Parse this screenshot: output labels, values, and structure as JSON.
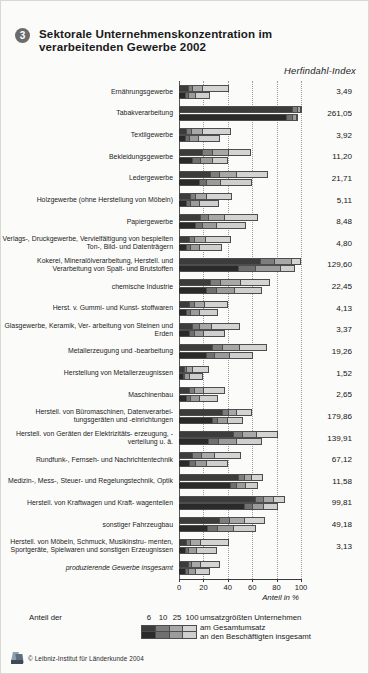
{
  "header": {
    "number": "3",
    "title": "Sektorale Unternehmenskonzentration im verarbeitenden Gewerbe 2002",
    "value_column_title": "Herfindahl-Index"
  },
  "footer": {
    "credit": "© Leibniz-Institut für Länderkunde 2004",
    "logo_name": "leibniz-institut-logo"
  },
  "legend": {
    "prefix": "Anteil der",
    "classes": [
      "6",
      "10",
      "25",
      "100"
    ],
    "suffix": "umsatzgrößten Unternehmen",
    "row1": "am Gesamtumsatz",
    "row2": "an den Beschäftigten insgesamt",
    "colors_row1": [
      "#3c3c3c",
      "#7d7d7d",
      "#a8a8a8",
      "#d4d4d4"
    ],
    "colors_row2": [
      "#2a2a2a",
      "#6f6f6f",
      "#9b9b9b",
      "#cfcfcf"
    ]
  },
  "chart_data": {
    "type": "bar",
    "orientation": "horizontal",
    "stacked": true,
    "grouped_pairs": true,
    "title": "Sektorale Unternehmenskonzentration im verarbeitenden Gewerbe 2002",
    "xlabel": "Anteil in %",
    "ylabel": "",
    "xlim": [
      0,
      100
    ],
    "xticks": [
      0,
      20,
      40,
      60,
      80,
      100
    ],
    "xtick_labels": [
      "0",
      "20",
      "40",
      "60",
      "80",
      "100"
    ],
    "grid": "vertical dotted at 20,40,60,80,100",
    "legend_position": "bottom",
    "value_axis_label": "Herfindahl-Index",
    "series": [
      {
        "name": "Anteil der 6 umsatzgrößten Unternehmen",
        "color": "#3c3c3c"
      },
      {
        "name": "Anteil der 10 umsatzgrößten Unternehmen",
        "color": "#7d7d7d"
      },
      {
        "name": "Anteil der 25 umsatzgrößten Unternehmen",
        "color": "#a8a8a8"
      },
      {
        "name": "Anteil der 100 umsatzgrößten Unternehmen",
        "color": "#d4d4d4"
      }
    ],
    "subseries": [
      {
        "name": "am Gesamtumsatz",
        "row": 1
      },
      {
        "name": "an den Beschäftigten insgesamt",
        "row": 2
      }
    ],
    "categories": [
      {
        "label": "Ernährungsgewerbe",
        "italic": false,
        "herfindahl": "3,49",
        "umsatz": [
          7.5,
          3.5,
          7.5,
          21.5
        ],
        "beschaeftigte": [
          5.0,
          2.5,
          6.0,
          11.0
        ]
      },
      {
        "label": "Tabakverarbeitung",
        "italic": false,
        "herfindahl": "261,05",
        "umsatz": [
          93.0,
          4.0,
          2.0,
          1.0
        ],
        "beschaeftigte": [
          88.0,
          4.5,
          3.0,
          1.5
        ]
      },
      {
        "label": "Textilgewerbe",
        "italic": false,
        "herfindahl": "3,92",
        "umsatz": [
          6.0,
          4.0,
          9.0,
          23.0
        ],
        "beschaeftigte": [
          5.0,
          3.0,
          7.5,
          17.0
        ]
      },
      {
        "label": "Bekleidungsgewerbe",
        "italic": false,
        "herfindahl": "11,20",
        "umsatz": [
          19.0,
          8.0,
          13.0,
          18.0
        ],
        "beschaeftigte": [
          11.0,
          6.0,
          10.0,
          12.5
        ]
      },
      {
        "label": "Ledergewerbe",
        "italic": false,
        "herfindahl": "21,71",
        "umsatz": [
          25.0,
          8.0,
          14.0,
          25.0
        ],
        "beschaeftigte": [
          16.0,
          6.0,
          12.0,
          25.0
        ]
      },
      {
        "label": "Holzgewerbe (ohne Herstellung von Möbeln)",
        "italic": false,
        "herfindahl": "5,11",
        "umsatz": [
          9.0,
          4.0,
          9.0,
          21.0
        ],
        "beschaeftigte": [
          6.0,
          3.0,
          7.0,
          16.0
        ]
      },
      {
        "label": "Papiergewerbe",
        "italic": false,
        "herfindahl": "8,48",
        "umsatz": [
          17.0,
          7.0,
          13.0,
          27.0
        ],
        "beschaeftigte": [
          13.0,
          6.0,
          11.0,
          24.0
        ]
      },
      {
        "label": "Verlags-, Druckgewerbe, Vervielfältigung von bespielten Ton-, Bild- und Datenträgern",
        "italic": false,
        "herfindahl": "4,80",
        "umsatz": [
          8.0,
          4.0,
          9.0,
          21.0
        ],
        "beschaeftigte": [
          6.0,
          3.0,
          7.5,
          18.0
        ]
      },
      {
        "label": "Kokerei, Mineralölverarbeitung, Herstell. und Verarbeitung von Spalt- und Brutstoffen",
        "italic": false,
        "herfindahl": "129,60",
        "umsatz": [
          66.0,
          12.0,
          14.0,
          7.0
        ],
        "beschaeftigte": [
          48.0,
          14.0,
          21.0,
          11.0
        ]
      },
      {
        "label": "chemische Industrie",
        "italic": false,
        "herfindahl": "22,45",
        "umsatz": [
          25.0,
          9.0,
          16.0,
          24.0
        ],
        "beschaeftigte": [
          22.0,
          8.0,
          15.0,
          22.0
        ]
      },
      {
        "label": "Herst. v. Gummi- und Kunst- stoffwaren",
        "italic": false,
        "herfindahl": "4,13",
        "umsatz": [
          8.0,
          4.0,
          8.5,
          19.0
        ],
        "beschaeftigte": [
          6.0,
          3.0,
          7.0,
          15.0
        ]
      },
      {
        "label": "Glasgewerbe, Keramik, Ver- arbeitung von Steinen und Erden",
        "italic": false,
        "herfindahl": "3,37",
        "umsatz": [
          11.0,
          5.0,
          10.0,
          23.0
        ],
        "beschaeftigte": [
          8.0,
          4.0,
          8.0,
          17.0
        ]
      },
      {
        "label": "Metallerzeugung und -bearbeitung",
        "italic": false,
        "herfindahl": "19,26",
        "umsatz": [
          27.0,
          8.0,
          14.0,
          22.0
        ],
        "beschaeftigte": [
          22.0,
          7.0,
          12.0,
          19.0
        ]
      },
      {
        "label": "Herstellung von Metallerzeugnissen",
        "italic": false,
        "herfindahl": "1,52",
        "umsatz": [
          4.0,
          2.0,
          5.0,
          13.0
        ],
        "beschaeftigte": [
          3.0,
          1.5,
          4.0,
          10.0
        ]
      },
      {
        "label": "Maschinenbau",
        "italic": false,
        "herfindahl": "2,65",
        "umsatz": [
          8.0,
          4.0,
          8.0,
          17.0
        ],
        "beschaeftigte": [
          6.0,
          3.0,
          7.0,
          15.0
        ]
      },
      {
        "label": "Herstell. von Büromaschinen, Datenverarbei- tungsgeräten und -einrichtungen",
        "italic": false,
        "herfindahl": "179,86",
        "umsatz": [
          35.0,
          5.0,
          7.0,
          12.0
        ],
        "beschaeftigte": [
          27.0,
          4.0,
          8.0,
          13.0
        ]
      },
      {
        "label": "Herstell. von Geräten der Elektrizitäts- erzeugung, -verteilung u. ä.",
        "italic": false,
        "herfindahl": "139,91",
        "umsatz": [
          44.0,
          8.0,
          11.0,
          17.0
        ],
        "beschaeftigte": [
          24.0,
          8.0,
          15.0,
          20.0
        ]
      },
      {
        "label": "Rundfunk-, Fernseh- und Nachrichtentechnik",
        "italic": false,
        "herfindahl": "67,12",
        "umsatz": [
          11.0,
          7.0,
          11.0,
          21.0
        ],
        "beschaeftigte": [
          8.0,
          5.0,
          9.0,
          17.0
        ]
      },
      {
        "label": "Medizin-, Mess-, Steuer- und Regelungstechnik, Optik",
        "italic": false,
        "herfindahl": "11,58",
        "umsatz": [
          48.0,
          5.0,
          6.0,
          9.0
        ],
        "beschaeftigte": [
          42.0,
          5.0,
          7.0,
          10.0
        ]
      },
      {
        "label": "Herstell. von Kraftwagen und Kraft- wagenteilen",
        "italic": false,
        "herfindahl": "99,81",
        "umsatz": [
          62.0,
          7.0,
          8.0,
          9.0
        ],
        "beschaeftigte": [
          53.0,
          7.0,
          9.0,
          11.0
        ]
      },
      {
        "label": "sonstiger Fahrzeugbau",
        "italic": false,
        "herfindahl": "49,18",
        "umsatz": [
          33.0,
          8.0,
          12.0,
          17.0
        ],
        "beschaeftigte": [
          23.0,
          8.0,
          13.0,
          18.0
        ]
      },
      {
        "label": "Herstell. von Möbeln, Schmuck, Musikinstru- menten, Sportgeräte, Spielwaren und sonstigen Erzeugnissen",
        "italic": false,
        "herfindahl": "3,13",
        "umsatz": [
          6.0,
          3.0,
          8.0,
          23.0
        ],
        "beschaeftigte": [
          5.0,
          2.5,
          6.5,
          16.0
        ]
      },
      {
        "label": "produzierende Gewerbe insgesamt",
        "italic": true,
        "herfindahl": "",
        "umsatz": [
          7.0,
          3.0,
          7.0,
          16.0
        ],
        "beschaeftigte": [
          5.0,
          2.5,
          5.5,
          12.0
        ]
      }
    ]
  }
}
